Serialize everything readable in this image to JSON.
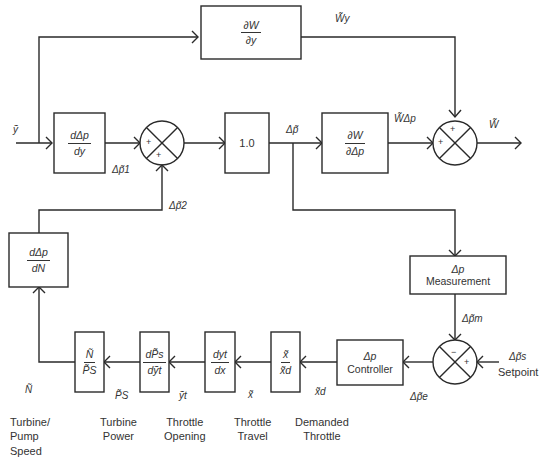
{
  "blocks": {
    "dW_dy": {
      "num": "∂W",
      "den": "∂y"
    },
    "ddp_dy": {
      "num": "dΔp",
      "den": "dy"
    },
    "unity": {
      "text": "1.0"
    },
    "dW_ddp": {
      "num": "∂W",
      "den": "∂Δp"
    },
    "ddp_dN": {
      "num": "dΔp",
      "den": "dN"
    },
    "dp_measurement": {
      "line1": "Δp",
      "line2": "Measurement"
    },
    "dp_controller": {
      "line1": "Δp",
      "line2": "Controller"
    },
    "x_over_xd": {
      "num": "x̃",
      "den": "x̃d"
    },
    "dyt_dx": {
      "num": "dyt",
      "den": "dx"
    },
    "dPs_dyt": {
      "num": "dP̃s",
      "den": "dỹt"
    },
    "N_over_Ps": {
      "num": "Ñ",
      "den": "P̃S"
    }
  },
  "signals": {
    "y": "ỹ",
    "W_y": "W̃y",
    "dp1": "Δp̃1",
    "dp2": "Δp̃2",
    "dp": "Δp̃",
    "W_dp": "W̃Δp",
    "W": "W̃",
    "dp_m": "Δp̃m",
    "dp_s": "Δp̃s",
    "dp_e": "Δp̃e",
    "x_d": "x̃d",
    "x": "x̃",
    "y_t": "ỹt",
    "P_S": "P̃S",
    "N": "Ñ"
  },
  "summing_signs": {
    "sum1_left": "+",
    "sum1_bottom": "+",
    "sum2_top": "+",
    "sum2_left": "+",
    "sum3_top": "−",
    "sum3_right": "+"
  },
  "captions": {
    "setpoint": "Setpoint",
    "turbine_pump_speed": "Turbine/\nPump\nSpeed",
    "turbine_power": "Turbine\nPower",
    "throttle_opening": "Throttle\nOpening",
    "throttle_travel": "Throttle\nTravel",
    "demanded_throttle": "Demanded\nThrottle"
  }
}
